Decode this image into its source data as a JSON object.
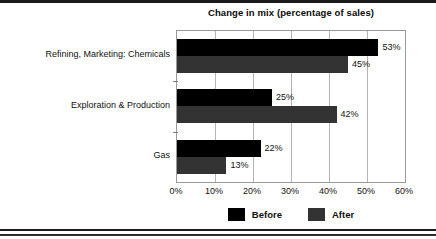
{
  "chart_data": {
    "type": "bar",
    "orientation": "horizontal",
    "title": "Change in mix (percentage of sales)",
    "xlabel": "",
    "ylabel": "",
    "xlim": [
      0,
      60
    ],
    "xticks": [
      "0%",
      "10%",
      "20%",
      "30%",
      "40%",
      "50%",
      "60%"
    ],
    "xtick_values": [
      0,
      10,
      20,
      30,
      40,
      50,
      60
    ],
    "grid": true,
    "grid_axis": "x",
    "legend_position": "bottom-center",
    "categories": [
      "Refining, Marketing: Chemicals",
      "Exploration & Production",
      "Gas"
    ],
    "series": [
      {
        "name": "Before",
        "color": "#000000",
        "values": [
          53,
          25,
          22
        ],
        "labels": [
          "53%",
          "45%",
          "22%"
        ]
      },
      {
        "name": "After",
        "color": "#333333",
        "values": [
          45,
          42,
          13
        ],
        "labels": [
          "45%",
          "42%",
          "13%"
        ]
      }
    ],
    "data_labels": {
      "Refining, Marketing: Chemicals": {
        "Before": "53%",
        "After": "45%"
      },
      "Exploration & Production": {
        "Before": "25%",
        "After": "42%"
      },
      "Gas": {
        "Before": "22%",
        "After": "13%"
      }
    }
  },
  "legend": {
    "items": [
      {
        "label": "Before",
        "color": "#000000"
      },
      {
        "label": "After",
        "color": "#333333"
      }
    ]
  }
}
